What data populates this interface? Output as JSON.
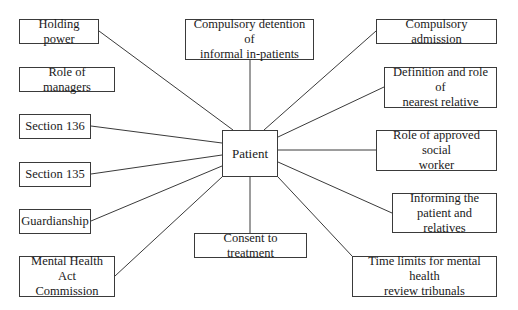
{
  "diagram": {
    "center": {
      "label": "Patient",
      "x": 222,
      "y": 130,
      "w": 56,
      "h": 47
    },
    "nodes": [
      {
        "id": "holding-power",
        "label": "Holding power",
        "x": 19,
        "y": 19,
        "w": 80,
        "h": 25,
        "anchor": [
          99,
          31
        ],
        "target": [
          233,
          130
        ]
      },
      {
        "id": "role-of-managers",
        "label": "Role of managers",
        "x": 19,
        "y": 67,
        "w": 96,
        "h": 25,
        "anchor": null,
        "target": null
      },
      {
        "id": "section-136",
        "label": "Section 136",
        "x": 19,
        "y": 114,
        "w": 72,
        "h": 25,
        "anchor": [
          91,
          126
        ],
        "target": [
          222,
          143
        ]
      },
      {
        "id": "section-135",
        "label": "Section 135",
        "x": 19,
        "y": 162,
        "w": 72,
        "h": 25,
        "anchor": [
          91,
          174
        ],
        "target": [
          222,
          155
        ]
      },
      {
        "id": "guardianship",
        "label": "Guardianship",
        "x": 19,
        "y": 209,
        "w": 72,
        "h": 25,
        "anchor": [
          91,
          221
        ],
        "target": [
          222,
          166
        ]
      },
      {
        "id": "mental-health-act-commission",
        "label": "Mental Health Act\nCommission",
        "x": 19,
        "y": 256,
        "w": 96,
        "h": 41,
        "anchor": [
          115,
          276
        ],
        "target": [
          222,
          177
        ]
      },
      {
        "id": "compulsory-detention",
        "label": "Compulsory detention of\ninformal in-patients",
        "x": 185,
        "y": 19,
        "w": 129,
        "h": 41,
        "anchor": [
          250,
          60
        ],
        "target": [
          250,
          130
        ]
      },
      {
        "id": "consent-to-treatment",
        "label": "Consent to treatment",
        "x": 194,
        "y": 233,
        "w": 113,
        "h": 25,
        "anchor": [
          250,
          233
        ],
        "target": [
          250,
          177
        ]
      },
      {
        "id": "compulsory-admission",
        "label": "Compulsory admission",
        "x": 376,
        "y": 19,
        "w": 121,
        "h": 25,
        "anchor": [
          376,
          31
        ],
        "target": [
          264,
          130
        ]
      },
      {
        "id": "nearest-relative",
        "label": "Definition and role of\nnearest relative",
        "x": 384,
        "y": 67,
        "w": 113,
        "h": 41,
        "anchor": [
          384,
          87
        ],
        "target": [
          278,
          137
        ]
      },
      {
        "id": "approved-social-worker",
        "label": "Role of approved social\nworker",
        "x": 376,
        "y": 130,
        "w": 121,
        "h": 41,
        "anchor": [
          376,
          150
        ],
        "target": [
          278,
          150
        ]
      },
      {
        "id": "informing-patient",
        "label": "Informing the\npatient and relatives",
        "x": 392,
        "y": 193,
        "w": 105,
        "h": 40,
        "anchor": [
          392,
          213
        ],
        "target": [
          278,
          162
        ]
      },
      {
        "id": "time-limits",
        "label": "Time limits for mental health\nreview tribunals",
        "x": 352,
        "y": 256,
        "w": 145,
        "h": 41,
        "anchor": [
          352,
          256
        ],
        "target": [
          278,
          177
        ]
      }
    ],
    "line_color": "#3a3a3a",
    "border_color": "#3a3a3a"
  }
}
